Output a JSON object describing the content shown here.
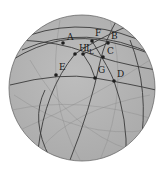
{
  "diagram": {
    "type": "spherical-geometry",
    "sphere": {
      "cx": 82,
      "cy": 88,
      "r": 73,
      "fill": "#b4b4b4",
      "stroke": "#6a6a6a"
    },
    "points": [
      {
        "id": "A",
        "label": "A",
        "x": 63,
        "y": 43,
        "lx": 67,
        "ly": 40
      },
      {
        "id": "F",
        "label": "F",
        "x": 92,
        "y": 41,
        "lx": 95,
        "ly": 36
      },
      {
        "id": "B",
        "label": "B",
        "x": 108,
        "y": 43,
        "lx": 111,
        "ly": 39
      },
      {
        "id": "H",
        "label": "H",
        "x": 75,
        "y": 54,
        "lx": 79,
        "ly": 51
      },
      {
        "id": "I",
        "label": "I",
        "x": 83,
        "y": 54,
        "lx": 86,
        "ly": 51
      },
      {
        "id": "L",
        "label": "L",
        "x": 90,
        "y": 52,
        "lx": 89,
        "ly": 53
      },
      {
        "id": "C",
        "label": "C",
        "x": 103,
        "y": 57,
        "lx": 107,
        "ly": 54
      },
      {
        "id": "E",
        "label": "E",
        "x": 56,
        "y": 75,
        "lx": 59,
        "ly": 70
      },
      {
        "id": "G",
        "label": "G",
        "x": 95,
        "y": 78,
        "lx": 98,
        "ly": 73
      },
      {
        "id": "D",
        "label": "D",
        "x": 114,
        "y": 81,
        "lx": 117,
        "ly": 77
      }
    ]
  }
}
